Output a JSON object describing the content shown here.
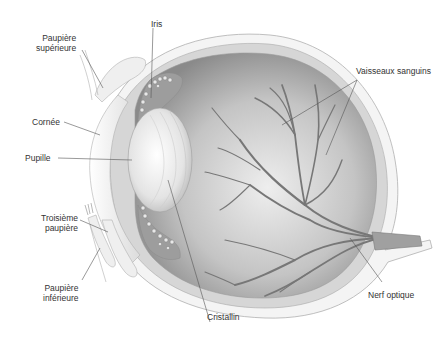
{
  "diagram": {
    "labels": {
      "paupiere_superieure": [
        "Paupière",
        "supérieure"
      ],
      "iris": "Iris",
      "cornee": "Cornée",
      "pupille": "Pupille",
      "troisieme_paupiere": [
        "Troisième",
        "paupière"
      ],
      "paupiere_inferieure": [
        "Paupière",
        "inférieure"
      ],
      "cristallin": "Cristallin",
      "vaisseaux_sanguins": "Vaisseaux sanguins",
      "nerf_optique": "Nerf optique"
    },
    "colors": {
      "background": "#ffffff",
      "outline": "#a8a8a8",
      "sclera": "#d9d9d9",
      "interior_dark": "#8c8c8c",
      "interior_light": "#e8e8e8",
      "vessels": "#7a7a7a",
      "leader_lines": "#555555",
      "text": "#333333"
    }
  }
}
